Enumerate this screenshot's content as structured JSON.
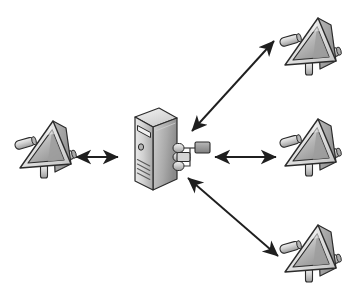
{
  "diagram": {
    "background_color": "#ffffff",
    "width": 352,
    "height": 295,
    "stroke_color": "#1a1a1a",
    "device_fill_light": "#e8e8e8",
    "device_fill_mid": "#c4c4c4",
    "device_fill_dark": "#9a9a9a",
    "device_fill_darker": "#7d7d7d",
    "server_fill_light": "#dcdcdc",
    "server_fill_mid": "#bfbfbf",
    "server_fill_dark": "#8f8f8f",
    "arrow_color": "#1f1f1f"
  },
  "nodes": [
    {
      "id": "server-center",
      "name": "server",
      "icon": "server-tower-icon",
      "label": "",
      "x": 155,
      "y": 153,
      "role": "central server"
    },
    {
      "id": "device-left",
      "name": "network-device-left",
      "icon": "wedge-router-icon",
      "label": "",
      "x": 44,
      "y": 148,
      "role": "peer device"
    },
    {
      "id": "device-top-right",
      "name": "network-device-top-right",
      "icon": "wedge-router-icon",
      "label": "",
      "x": 309,
      "y": 45,
      "role": "peer device"
    },
    {
      "id": "device-middle-right",
      "name": "network-device-middle-right",
      "icon": "wedge-router-icon",
      "label": "",
      "x": 309,
      "y": 146,
      "role": "peer device"
    },
    {
      "id": "device-bottom-right",
      "name": "network-device-bottom-right",
      "icon": "wedge-router-icon",
      "label": "",
      "x": 309,
      "y": 252,
      "role": "peer device"
    }
  ],
  "connections": [
    {
      "id": "conn-left",
      "name": "connection-server-to-left-device",
      "from": "server-center",
      "to": "device-left",
      "style": "double-headed-arrow",
      "label": "",
      "x1": 118,
      "y1": 157,
      "x2": 76,
      "y2": 157
    },
    {
      "id": "conn-top-right",
      "name": "connection-server-to-top-right-device",
      "from": "server-center",
      "to": "device-top-right",
      "style": "double-headed-arrow",
      "label": "",
      "x1": 192,
      "y1": 131,
      "x2": 274,
      "y2": 41
    },
    {
      "id": "conn-middle-right",
      "name": "connection-server-to-middle-right-device",
      "from": "server-center",
      "to": "device-middle-right",
      "style": "double-headed-arrow",
      "label": "",
      "x1": 215,
      "y1": 157,
      "x2": 276,
      "y2": 157
    },
    {
      "id": "conn-bottom-right",
      "name": "connection-server-to-bottom-right-device",
      "from": "server-center",
      "to": "device-bottom-right",
      "style": "double-headed-arrow",
      "label": "",
      "x1": 188,
      "y1": 178,
      "x2": 278,
      "y2": 256
    }
  ]
}
